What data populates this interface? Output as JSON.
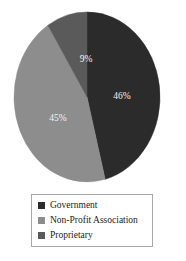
{
  "chart_data": {
    "type": "pie",
    "title": "",
    "categories": [
      "Government",
      "Non-Profit Association",
      "Proprietary"
    ],
    "values": [
      46,
      45,
      9
    ],
    "value_labels": [
      "46%",
      "45%",
      "9%"
    ],
    "units": "percent",
    "total": 100,
    "start_angle_deg": 0,
    "direction": "clockwise",
    "legend_position": "bottom",
    "grid": false,
    "colors": [
      "#2b2b2b",
      "#8d8d8d",
      "#5a5a5a"
    ],
    "label_color": "#f2f2f2",
    "slices": [
      {
        "label": "Government",
        "value": 46,
        "value_label": "46%",
        "color": "#2b2b2b",
        "start_deg": 0,
        "end_deg": 165.6,
        "label_x": 122,
        "label_y": 97
      },
      {
        "label": "Non-Profit Association",
        "value": 45,
        "value_label": "45%",
        "color": "#8d8d8d",
        "start_deg": 165.6,
        "end_deg": 327.6,
        "label_x": 58,
        "label_y": 119
      },
      {
        "label": "Proprietary",
        "value": 9,
        "value_label": "9%",
        "color": "#5a5a5a",
        "start_deg": 327.6,
        "end_deg": 360,
        "label_x": 86,
        "label_y": 60
      }
    ],
    "geometry": {
      "center_x": 87,
      "center_y": 97,
      "radius_x": 73,
      "radius_y": 85
    }
  },
  "legend": {
    "border_color": "#a8a8a8",
    "items": [
      {
        "label": "Government",
        "color": "#2b2b2b"
      },
      {
        "label": "Non-Profit Association",
        "color": "#8d8d8d"
      },
      {
        "label": "Proprietary",
        "color": "#5a5a5a"
      }
    ]
  }
}
